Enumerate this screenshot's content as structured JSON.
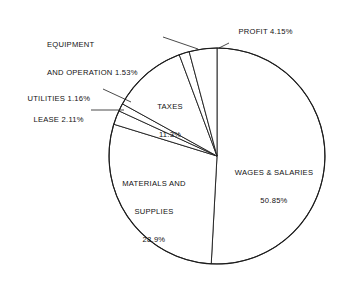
{
  "chart_data": {
    "type": "pie",
    "title": "",
    "subtitle": "",
    "xlabel": "",
    "ylabel": "",
    "legend_position": "none",
    "grid": false,
    "units": "percent",
    "start_angle_deg": 0,
    "direction": "clockwise",
    "center": {
      "x": 217,
      "y": 156
    },
    "radius": 108,
    "categories": [
      "WAGES & SALARIES",
      "MATERIALS AND SUPPLIES",
      "LEASE",
      "UTILITIES",
      "TAXES",
      "EQUIPMENT AND OPERATION",
      "PROFIT"
    ],
    "values": [
      50.85,
      28.9,
      2.11,
      1.16,
      11.3,
      1.53,
      4.15
    ],
    "slices": [
      {
        "name": "WAGES & SALARIES",
        "value": 50.85,
        "value_text": "50.85%",
        "label_placement": "inside"
      },
      {
        "name": "MATERIALS AND SUPPLIES",
        "value": 28.9,
        "value_text": "28.9%",
        "label_placement": "inside"
      },
      {
        "name": "LEASE",
        "value": 2.11,
        "value_text": "2.11%",
        "label_placement": "outside-left"
      },
      {
        "name": "UTILITIES",
        "value": 1.16,
        "value_text": "1.16%",
        "label_placement": "outside-left"
      },
      {
        "name": "TAXES",
        "value": 11.3,
        "value_text": "11.3%",
        "label_placement": "inside"
      },
      {
        "name": "EQUIPMENT AND OPERATION",
        "value": 1.53,
        "value_text": "1.53%",
        "label_placement": "outside-top-left"
      },
      {
        "name": "PROFIT",
        "value": 4.15,
        "value_text": "4.15%",
        "label_placement": "outside-top-right"
      }
    ]
  },
  "labels": {
    "profit": "PROFIT 4.15%",
    "equipment_line1": "EQUIPMENT",
    "equipment_line2": "AND OPERATION 1.53%",
    "utilities": "UTILITIES 1.16%",
    "lease": "LEASE 2.11%",
    "taxes_line1": "TAXES",
    "taxes_line2": "11.3%",
    "wages_line1": "WAGES & SALARIES",
    "wages_line2": "50.85%",
    "materials_line1": "MATERIALS AND",
    "materials_line2": "SUPPLIES",
    "materials_line3": "28.9%"
  },
  "colors": {
    "stroke": "#1c1c1c",
    "fill": "#ffffff",
    "text": "#111111",
    "background": "#ffffff"
  }
}
